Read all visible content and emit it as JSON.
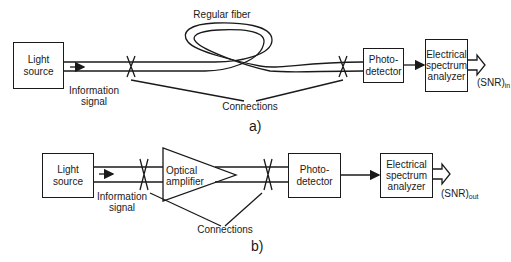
{
  "diagram_a": {
    "fiber_label": "Regular fiber",
    "light_source": [
      "Light",
      "source"
    ],
    "info_signal": [
      "Information",
      "signal"
    ],
    "connections": "Connections",
    "photodetector": [
      "Photo-",
      "detector"
    ],
    "esa": [
      "Electrical",
      "spectrum",
      "analyzer"
    ],
    "snr_main": "(SNR)",
    "snr_sub": "in",
    "caption": "a)"
  },
  "diagram_b": {
    "light_source": [
      "Light",
      "source"
    ],
    "info_signal": [
      "Information",
      "signal"
    ],
    "amplifier": [
      "Optical",
      "amplifier"
    ],
    "connections": "Connections",
    "photodetector": [
      "Photo-",
      "detector"
    ],
    "esa": [
      "Electrical",
      "spectrum",
      "analyzer"
    ],
    "snr_main": "(SNR)",
    "snr_sub": "out",
    "caption": "b)"
  },
  "colors": {
    "stroke": "#1a1a1a",
    "background": "#ffffff"
  }
}
